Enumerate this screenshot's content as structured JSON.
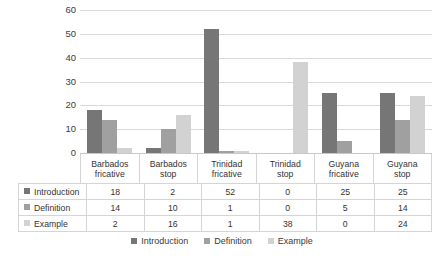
{
  "chart_data": {
    "type": "bar",
    "title": "",
    "xlabel": "",
    "ylabel": "",
    "ylim": [
      0,
      60
    ],
    "yticks": [
      60,
      50,
      40,
      30,
      20,
      10,
      0
    ],
    "grid": true,
    "legend_position": "bottom",
    "categories": [
      "Barbados fricative",
      "Barbados stop",
      "Trinidad fricative",
      "Trinidad stop",
      "Guyana fricative",
      "Guyana stop"
    ],
    "category_lines": [
      [
        "Barbados",
        "fricative"
      ],
      [
        "Barbados",
        "stop"
      ],
      [
        "Trinidad",
        "fricative"
      ],
      [
        "Trinidad",
        "stop"
      ],
      [
        "Guyana",
        "fricative"
      ],
      [
        "Guyana",
        "stop"
      ]
    ],
    "series": [
      {
        "name": "Introduction",
        "color": "#767676",
        "values": [
          18,
          2,
          52,
          0,
          25,
          25
        ]
      },
      {
        "name": "Definition",
        "color": "#a0a0a0",
        "values": [
          14,
          10,
          1,
          0,
          5,
          14
        ]
      },
      {
        "name": "Example",
        "color": "#d2d2d2",
        "values": [
          2,
          16,
          1,
          38,
          0,
          24
        ]
      }
    ]
  },
  "table": {
    "rows": [
      {
        "label": "Introduction",
        "values": [
          "18",
          "2",
          "52",
          "0",
          "25",
          "25"
        ]
      },
      {
        "label": "Definition",
        "values": [
          "14",
          "10",
          "1",
          "0",
          "5",
          "14"
        ]
      },
      {
        "label": "Example",
        "values": [
          "2",
          "16",
          "1",
          "38",
          "0",
          "24"
        ]
      }
    ]
  },
  "legend": {
    "items": [
      "Introduction",
      "Definition",
      "Example"
    ]
  }
}
